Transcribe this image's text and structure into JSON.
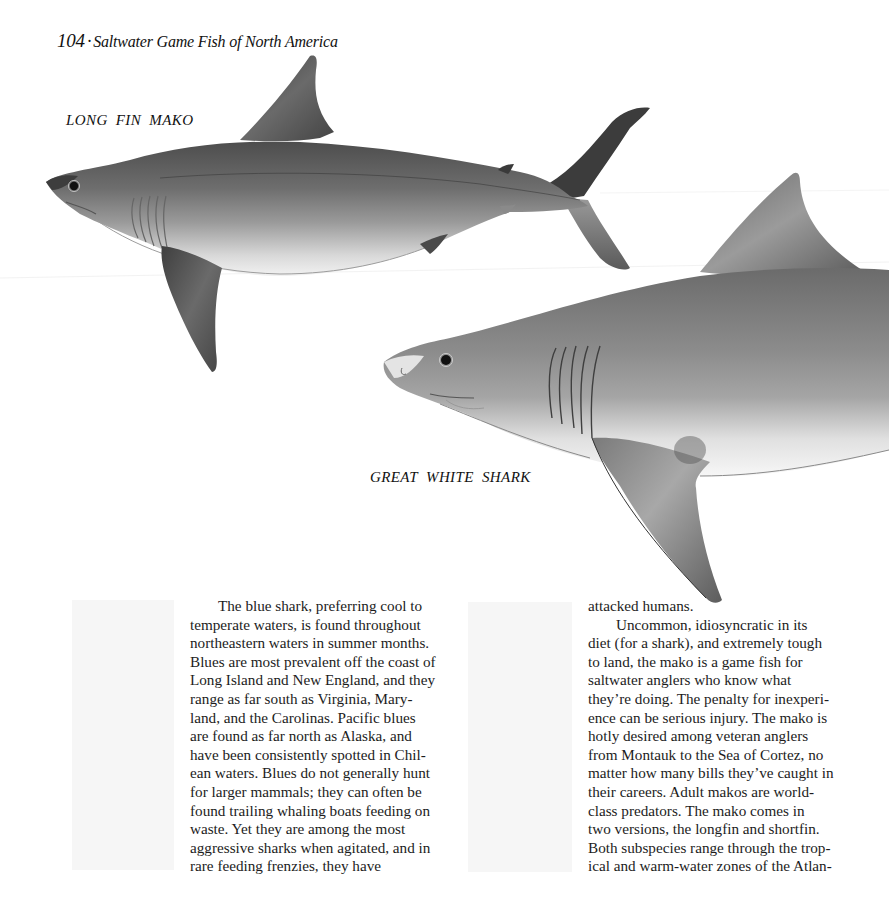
{
  "header": {
    "page_number": "104",
    "separator": "·",
    "book_title": "Saltwater Game Fish of North America"
  },
  "illustrations": {
    "top": {
      "caption": "LONG FIN MAKO",
      "subject": "long-fin-mako-shark-illustration"
    },
    "bottom": {
      "caption": "GREAT WHITE SHARK",
      "subject": "great-white-shark-illustration"
    }
  },
  "colors": {
    "paper": "#ffffff",
    "ink": "#1a1a1a",
    "shark_dark": "#4a4a4a",
    "shark_mid": "#8a8a8a",
    "shark_light": "#e8e8e8"
  },
  "body_text": {
    "left_column": [
      "The blue shark, preferring cool to",
      "temperate waters, is found throughout",
      "northeastern waters in summer months.",
      "Blues are most prevalent off the coast of",
      "Long Island and New England, and they",
      "range as far south as Virginia, Mary-",
      "land, and the Carolinas. Pacific blues",
      "are found as far north as Alaska, and",
      "have been consistently spotted in Chil-",
      "ean waters. Blues do not generally hunt",
      "for larger mammals; they can often be",
      "found trailing whaling boats feeding on",
      "waste. Yet they are among the most",
      "aggressive sharks when agitated, and in",
      "rare feeding frenzies, they have"
    ],
    "right_column": [
      "attacked humans.",
      "Uncommon, idiosyncratic in its",
      "diet (for a shark), and extremely tough",
      "to land, the mako is a game fish for",
      "saltwater anglers who know what",
      "they’re doing. The penalty for inexperi-",
      "ence can be serious injury. The mako is",
      "hotly desired among veteran anglers",
      "from Montauk to the Sea of Cortez, no",
      "matter how many bills they’ve caught in",
      "their careers. Adult makos are world-",
      "class predators. The mako comes in",
      "two versions, the longfin and shortfin.",
      "Both subspecies range through the trop-",
      "ical and warm-water zones of the Atlan-"
    ]
  }
}
